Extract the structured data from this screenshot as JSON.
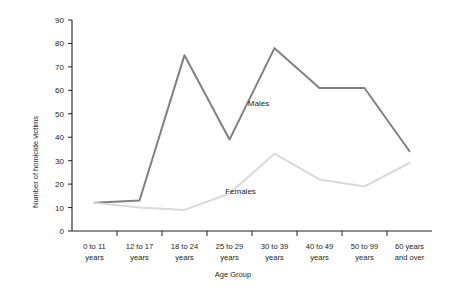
{
  "chart_data": {
    "type": "line",
    "title": "",
    "xlabel": "Age Group",
    "ylabel": "Number of homicide victims",
    "categories": [
      "0 to 11 years",
      "12 to 17 years",
      "18 to 24 years",
      "25 to 29 years",
      "30 to 39 years",
      "40 to 49 years",
      "50 to 99 years",
      "60 years and over"
    ],
    "category_lines": [
      [
        "0 to 11",
        "years"
      ],
      [
        "12 to 17",
        "years"
      ],
      [
        "18 to 24",
        "years"
      ],
      [
        "25 to 29",
        "years"
      ],
      [
        "30 to 39",
        "years"
      ],
      [
        "40 to 49",
        "years"
      ],
      [
        "50 to 99",
        "years"
      ],
      [
        "60 years",
        "and over"
      ]
    ],
    "series": [
      {
        "name": "Males",
        "color": "#808080",
        "values": [
          12,
          13,
          75,
          39,
          78,
          61,
          61,
          34
        ]
      },
      {
        "name": "Females",
        "color": "#d9d9d9",
        "values": [
          12,
          10,
          9,
          16,
          33,
          22,
          19,
          29
        ]
      }
    ],
    "ylim": [
      0,
      90
    ],
    "yticks": [
      0,
      10,
      20,
      30,
      40,
      50,
      60,
      70,
      80,
      90
    ],
    "ytick_labels": [
      "0",
      "10",
      "20",
      "30",
      "40",
      "50",
      "60",
      "70",
      "80",
      "90"
    ],
    "grid": false,
    "legend": "inline-annotations",
    "annotations": [
      {
        "text": "Males",
        "series": "Males"
      },
      {
        "text": "Females",
        "series": "Females"
      }
    ]
  }
}
